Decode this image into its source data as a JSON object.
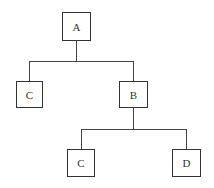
{
  "diagram": {
    "type": "tree",
    "nodes": [
      {
        "id": "A",
        "label": "A"
      },
      {
        "id": "C1",
        "label": "C"
      },
      {
        "id": "B",
        "label": "B"
      },
      {
        "id": "C2",
        "label": "C"
      },
      {
        "id": "D",
        "label": "D"
      }
    ],
    "edges": [
      {
        "from": "A",
        "to": "C1"
      },
      {
        "from": "A",
        "to": "B"
      },
      {
        "from": "B",
        "to": "C2"
      },
      {
        "from": "B",
        "to": "D"
      }
    ]
  }
}
